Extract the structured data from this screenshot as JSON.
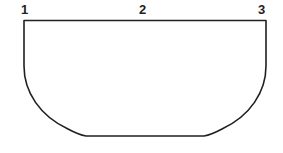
{
  "figure": {
    "background_color": "#ffffff",
    "stroke_color": "#231f20",
    "stroke_width": 1.6,
    "fill_color": "#ffffff",
    "shape_name": "bowl-outline"
  },
  "labels": {
    "left": "1",
    "center": "2",
    "right": "3"
  },
  "geometry": {
    "top_rim": {
      "x1": 24,
      "y1": 20.5,
      "x2": 266,
      "y2": 20.5
    },
    "left_wall": {
      "x": 24,
      "y_top": 20.5,
      "y_bottom": 68
    },
    "right_wall": {
      "x": 266,
      "y_top": 20.5,
      "y_bottom": 68
    },
    "base": {
      "x1": 86,
      "y1": 136,
      "x2": 204,
      "y2": 136
    },
    "left_curve_control": {
      "cx1": 30,
      "cy1": 104,
      "cx2": 52,
      "cy2": 130
    },
    "right_curve_control": {
      "cx1": 238,
      "cy1": 130,
      "cx2": 260,
      "cy2": 104
    },
    "label_positions": {
      "left": {
        "x": 21,
        "y": 3
      },
      "center": {
        "x": 139,
        "y": 3
      },
      "right": {
        "x": 258,
        "y": 3
      }
    }
  }
}
